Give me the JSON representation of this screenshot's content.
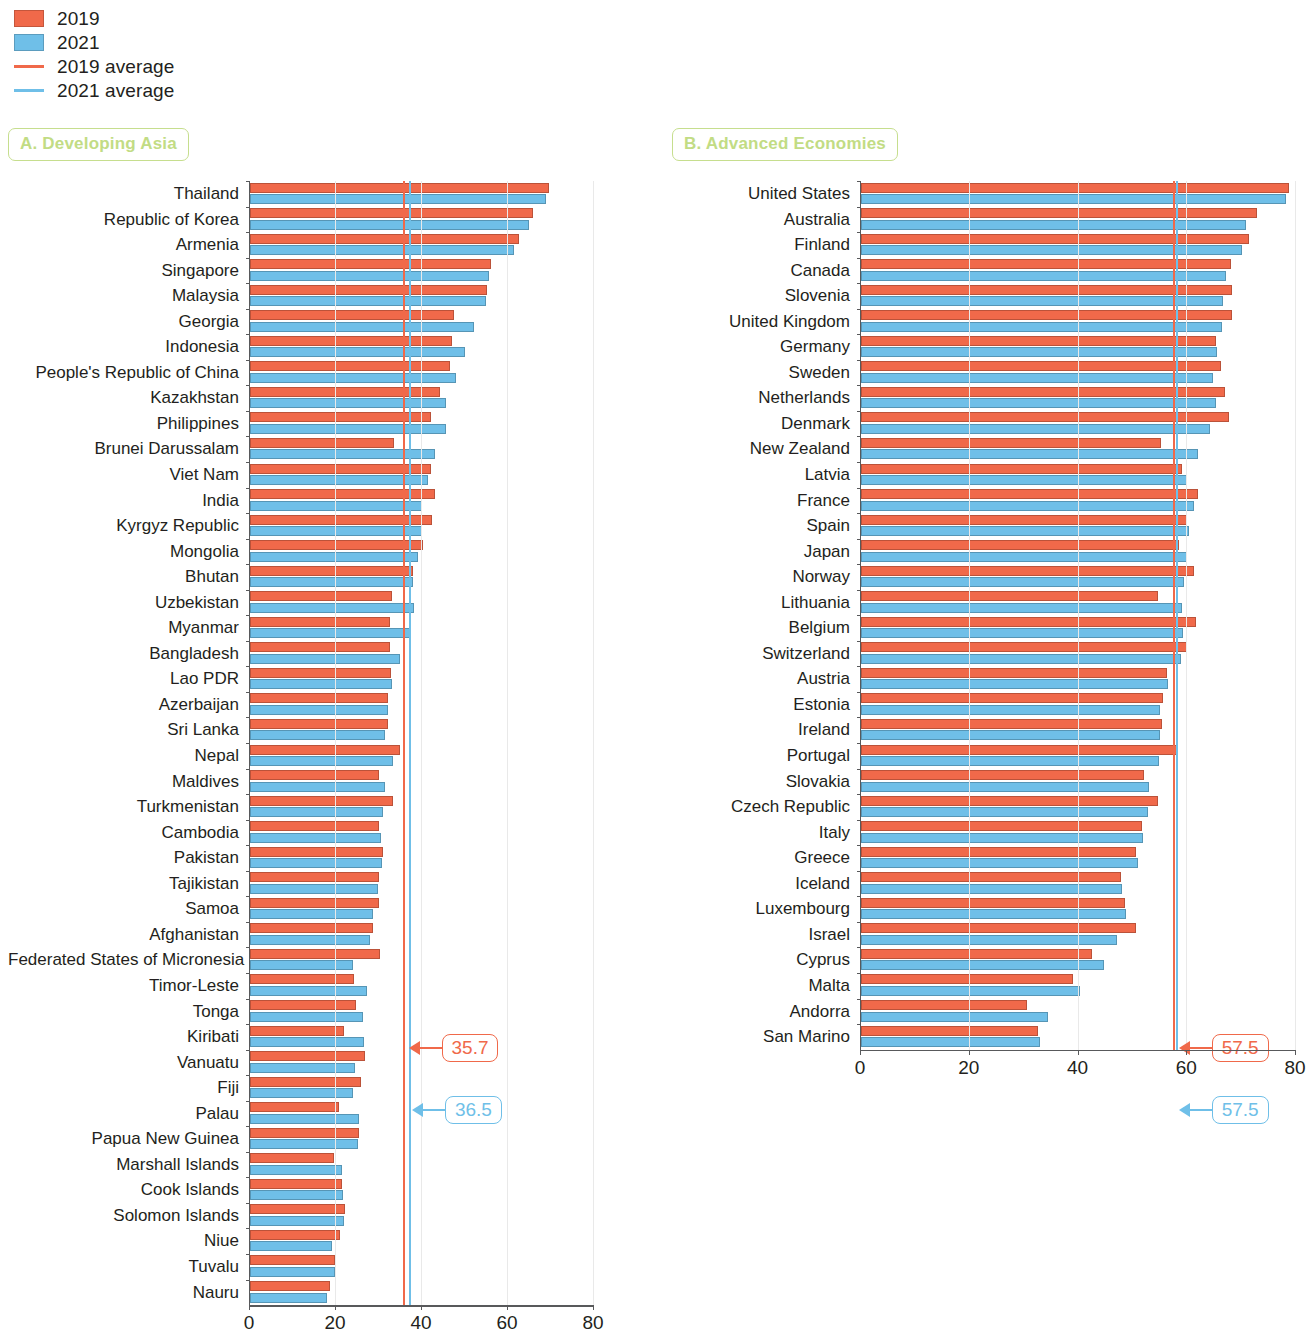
{
  "legend": {
    "items": [
      {
        "label": "2019",
        "type": "swatch",
        "color": "#f0694a"
      },
      {
        "label": "2021",
        "type": "swatch",
        "color": "#6fbfe8"
      },
      {
        "label": "2019 average",
        "type": "line",
        "color": "#f0694a"
      },
      {
        "label": "2021 average",
        "type": "line",
        "color": "#6fbfe8"
      }
    ]
  },
  "colors": {
    "bar_2019": "#f0694a",
    "bar_2021": "#6fbfe8",
    "avg_2019_line": "#f0694a",
    "avg_2021_line": "#6fbfe8",
    "panel_title_green": "#c2dc84",
    "axis": "#58595b"
  },
  "chart_data": [
    {
      "type": "bar",
      "title": "A. Developing Asia",
      "orientation": "horizontal",
      "grouped": true,
      "xlabel": "",
      "ylabel": "",
      "xlim": [
        0,
        80
      ],
      "xticks": [
        0,
        20,
        40,
        60,
        80
      ],
      "grid": true,
      "legend_position": "top-left",
      "categories": [
        "Thailand",
        "Republic of Korea",
        "Armenia",
        "Singapore",
        "Malaysia",
        "Georgia",
        "Indonesia",
        "People's Republic of China",
        "Kazakhstan",
        "Philippines",
        "Brunei Darussalam",
        "Viet Nam",
        "India",
        "Kyrgyz Republic",
        "Mongolia",
        "Bhutan",
        "Uzbekistan",
        "Myanmar",
        "Bangladesh",
        "Lao PDR",
        "Azerbaijan",
        "Sri Lanka",
        "Nepal",
        "Maldives",
        "Turkmenistan",
        "Cambodia",
        "Pakistan",
        "Tajikistan",
        "Samoa",
        "Afghanistan",
        "Federated States of Micronesia",
        "Timor-Leste",
        "Tonga",
        "Kiribati",
        "Vanuatu",
        "Fiji",
        "Palau",
        "Papua New Guinea",
        "Marshall Islands",
        "Cook Islands",
        "Solomon Islands",
        "Niue",
        "Tuvalu",
        "Nauru"
      ],
      "series": [
        {
          "name": "2019",
          "color": "#f0694a",
          "values": [
            69.5,
            65.8,
            62.6,
            56.0,
            55.2,
            47.5,
            47.0,
            46.6,
            44.3,
            42.0,
            33.6,
            42.0,
            43.0,
            42.3,
            40.2,
            38.0,
            33.0,
            32.5,
            32.6,
            32.8,
            32.0,
            32.0,
            34.8,
            30.0,
            33.3,
            30.0,
            31.0,
            30.0,
            30.1,
            28.5,
            30.3,
            24.3,
            24.7,
            21.8,
            26.8,
            25.8,
            20.8,
            25.4,
            19.5,
            21.4,
            22.0,
            21.0,
            19.8,
            18.5
          ]
        },
        {
          "name": "2021",
          "color": "#6fbfe8",
          "values": [
            68.8,
            64.8,
            61.4,
            55.5,
            54.8,
            52.0,
            50.0,
            48.0,
            45.5,
            45.5,
            43.0,
            41.4,
            40.0,
            40.0,
            39.0,
            38.0,
            38.2,
            37.5,
            34.8,
            33.0,
            32.2,
            31.4,
            33.2,
            31.5,
            31.0,
            30.5,
            30.8,
            29.8,
            28.5,
            27.8,
            24.0,
            27.3,
            26.3,
            26.6,
            24.5,
            24.0,
            25.4,
            25.0,
            21.3,
            21.6,
            21.8,
            19.0,
            19.8,
            18.0
          ]
        }
      ],
      "averages": [
        {
          "name": "2019 average",
          "value": 35.7,
          "color": "#f0694a",
          "label": "35.7"
        },
        {
          "name": "2021 average",
          "value": 36.5,
          "color": "#6fbfe8",
          "label": "36.5"
        }
      ]
    },
    {
      "type": "bar",
      "title": "B. Advanced Economies",
      "orientation": "horizontal",
      "grouped": true,
      "xlabel": "",
      "ylabel": "",
      "xlim": [
        0,
        80
      ],
      "xticks": [
        0,
        20,
        40,
        60,
        80
      ],
      "grid": true,
      "legend_position": "top-left",
      "categories": [
        "United States",
        "Australia",
        "Finland",
        "Canada",
        "Slovenia",
        "United Kingdom",
        "Germany",
        "Sweden",
        "Netherlands",
        "Denmark",
        "New Zealand",
        "Latvia",
        "France",
        "Spain",
        "Japan",
        "Norway",
        "Lithuania",
        "Belgium",
        "Switzerland",
        "Austria",
        "Estonia",
        "Ireland",
        "Portugal",
        "Slovakia",
        "Czech Republic",
        "Italy",
        "Greece",
        "Iceland",
        "Luxembourg",
        "Israel",
        "Cyprus",
        "Malta",
        "Andorra",
        "San Marino"
      ],
      "series": [
        {
          "name": "2019",
          "color": "#f0694a",
          "values": [
            78.7,
            72.8,
            71.4,
            68.0,
            68.3,
            68.2,
            65.2,
            66.2,
            67.0,
            67.6,
            55.2,
            59.0,
            62.0,
            60.0,
            58.5,
            61.2,
            54.6,
            61.6,
            60.0,
            56.2,
            55.6,
            55.4,
            58.2,
            52.0,
            54.6,
            51.6,
            50.6,
            47.8,
            48.5,
            50.6,
            42.4,
            39.0,
            30.5,
            32.5
          ]
        },
        {
          "name": "2021",
          "color": "#6fbfe8",
          "values": [
            78.2,
            70.8,
            70.0,
            67.2,
            66.5,
            66.4,
            65.4,
            64.8,
            65.2,
            64.2,
            62.0,
            60.0,
            61.2,
            60.4,
            60.0,
            59.4,
            59.0,
            59.2,
            58.8,
            56.4,
            55.0,
            55.0,
            54.8,
            53.0,
            52.8,
            51.8,
            51.0,
            48.0,
            48.8,
            47.0,
            44.6,
            40.2,
            34.4,
            33.0
          ]
        }
      ],
      "averages": [
        {
          "name": "2019 average",
          "value": 57.5,
          "color": "#f0694a",
          "label": "57.5"
        },
        {
          "name": "2021 average",
          "value": 57.5,
          "color": "#6fbfe8",
          "label": "57.5"
        }
      ]
    }
  ]
}
